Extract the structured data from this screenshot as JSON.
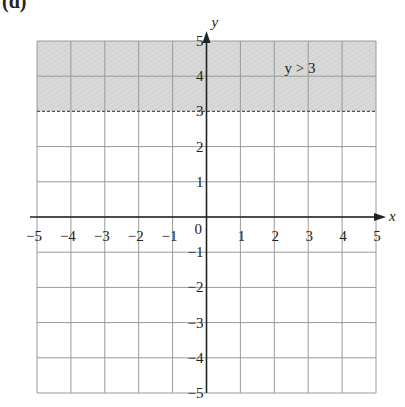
{
  "part_label": "(d)",
  "chart_data": {
    "type": "inequality-graph",
    "title": "",
    "xlabel": "x",
    "ylabel": "y",
    "xlim": [
      -5,
      5
    ],
    "ylim": [
      -5,
      5
    ],
    "grid": true,
    "x_ticks": [
      -5,
      -4,
      -3,
      -2,
      -1,
      0,
      1,
      2,
      3,
      4,
      5
    ],
    "y_ticks": [
      -5,
      -4,
      -3,
      -2,
      -1,
      1,
      2,
      3,
      4,
      5
    ],
    "x_tick_labels": [
      "−5",
      "−4",
      "−3",
      "−2",
      "−1",
      "0",
      "1",
      "2",
      "3",
      "4",
      "5"
    ],
    "y_tick_labels": [
      "−5",
      "−4",
      "−3",
      "−2",
      "−1",
      "1",
      "2",
      "3",
      "4",
      "5"
    ],
    "shaded_region": {
      "inequality": "y > 3",
      "y_from": 3,
      "y_to": 5,
      "boundary": "dashed",
      "color": "#d9d9d9"
    },
    "annotation": {
      "text": "y > 3",
      "x": 2.3,
      "y": 4.1
    }
  }
}
